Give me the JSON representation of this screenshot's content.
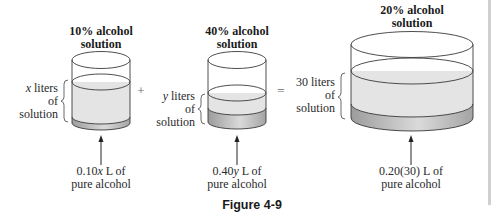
{
  "figure": {
    "caption": "Figure 4-9",
    "operators": {
      "plus": "+",
      "equals": "="
    },
    "containers": [
      {
        "id": "container-10",
        "title_line1": "10% alcohol",
        "title_line2": "solution",
        "volume_line1_var": "x",
        "volume_line1_rest": " liters",
        "volume_line2": "of",
        "volume_line3": "solution",
        "alcohol_line1_coef": "0.10",
        "alcohol_line1_var": "x",
        "alcohol_line1_rest": " L of",
        "alcohol_line2": "pure alcohol"
      },
      {
        "id": "container-40",
        "title_line1": "40% alcohol",
        "title_line2": "solution",
        "volume_line1_var": "y",
        "volume_line1_rest": " liters",
        "volume_line2": "of",
        "volume_line3": "solution",
        "alcohol_line1_coef": "0.40",
        "alcohol_line1_var": "y",
        "alcohol_line1_rest": " L of",
        "alcohol_line2": "pure alcohol"
      },
      {
        "id": "container-20",
        "title_line1": "20% alcohol",
        "title_line2": "solution",
        "volume_line1": "30 liters",
        "volume_line2": "of",
        "volume_line3": "solution",
        "alcohol_line1": "0.20(30) L of",
        "alcohol_line2": "pure alcohol"
      }
    ],
    "colors": {
      "liquid": "#e4e4e4",
      "band_edge": "#9c9c9c",
      "band_mid": "#d8d8d8",
      "outline": "#3a3a3a",
      "rule": "#cfcfcf"
    }
  }
}
